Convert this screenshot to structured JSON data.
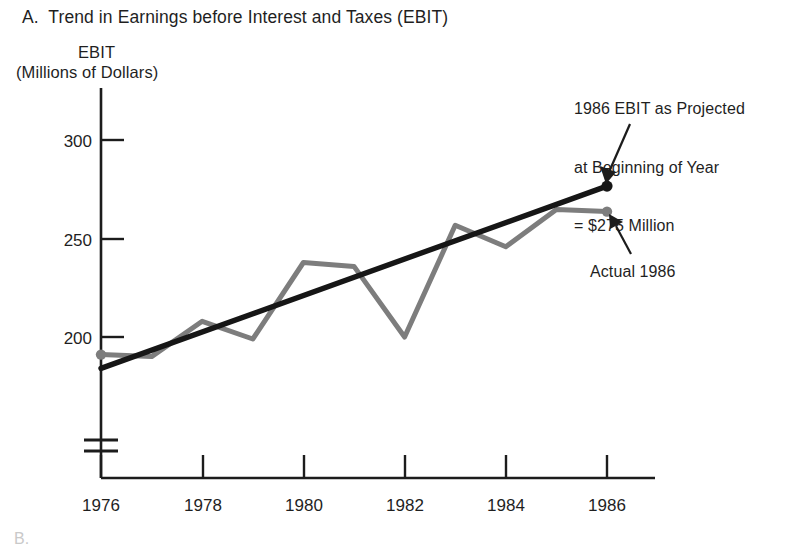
{
  "figure": {
    "panel_label": "A.  Trend in Earnings before Interest and Taxes (EBIT)",
    "footer_fragment": "B."
  },
  "annotations": {
    "projection": {
      "line1": "1986 EBIT as Projected",
      "line2": "at Beginning of Year",
      "line3": "= $275 Million"
    },
    "actual": "Actual 1986"
  },
  "chart_data": {
    "type": "line",
    "title": "A.  Trend in Earnings before Interest and Taxes (EBIT)",
    "subtitle": "",
    "xlabel": "",
    "ylabel": "EBIT",
    "ylabel_units": "(Millions of Dollars)",
    "x": [
      1976,
      1977,
      1978,
      1979,
      1980,
      1981,
      1982,
      1983,
      1984,
      1985,
      1986
    ],
    "xtick_labels": [
      "1976",
      "1978",
      "1980",
      "1982",
      "1984",
      "1986"
    ],
    "xticks": [
      1976,
      1978,
      1980,
      1982,
      1984,
      1986
    ],
    "ytick_labels": [
      "200",
      "250",
      "300"
    ],
    "yticks": [
      200,
      250,
      300
    ],
    "ylim": [
      180,
      310
    ],
    "xlim": [
      1976,
      1986.95
    ],
    "axis_break": true,
    "grid": false,
    "legend": "none",
    "series": [
      {
        "name": "Actual EBIT",
        "color": "#7d7d7d",
        "markers": true,
        "values": [
          191,
          190,
          208,
          199,
          238,
          236,
          200,
          257,
          246,
          265,
          264
        ]
      },
      {
        "name": "Trend (fitted)",
        "color": "#161616",
        "markers": true,
        "values": [
          184,
          193,
          203,
          212,
          221,
          230,
          240,
          249,
          258,
          267,
          277
        ]
      }
    ],
    "annotations": [
      {
        "name": "projected-1986",
        "text": "1986 EBIT as Projected at Beginning of Year = $275 Million",
        "points_to_series": "Trend (fitted)",
        "points_to_x": 1986,
        "points_to_y": 277
      },
      {
        "name": "actual-1986",
        "text": "Actual 1986",
        "points_to_series": "Actual EBIT",
        "points_to_x": 1986,
        "points_to_y": 264
      }
    ]
  }
}
